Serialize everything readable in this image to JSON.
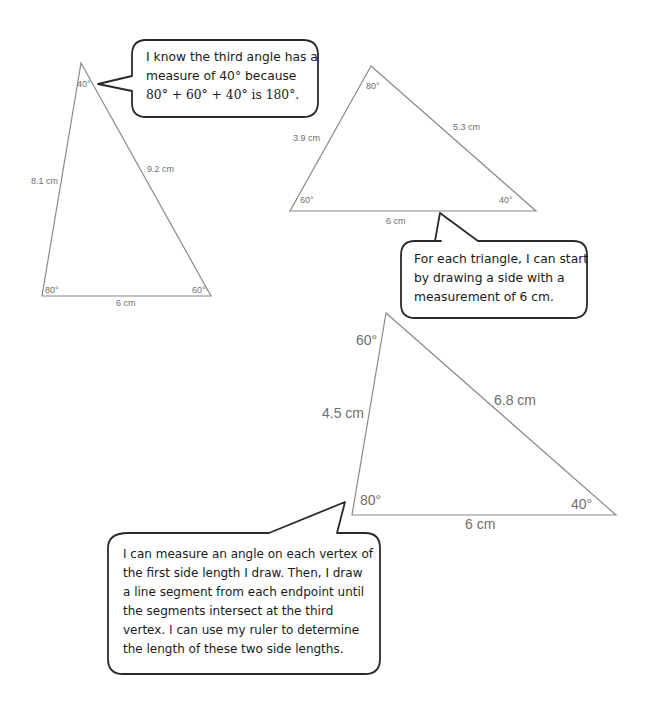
{
  "triangles": [
    {
      "id": "triangle-1",
      "angles": {
        "top": "40°",
        "bottom_left": "80°",
        "bottom_right": "60°"
      },
      "sides": {
        "left": "8.1 cm",
        "right": "9.2 cm",
        "base": "6 cm"
      }
    },
    {
      "id": "triangle-2",
      "angles": {
        "top": "80°",
        "bottom_left": "60°",
        "bottom_right": "40°"
      },
      "sides": {
        "left": "3.9 cm",
        "right": "5.3 cm",
        "base": "6 cm"
      }
    },
    {
      "id": "triangle-3",
      "angles": {
        "top": "60°",
        "bottom_left": "80°",
        "bottom_right": "40°"
      },
      "sides": {
        "left": "4.5 cm",
        "right": "6.8 cm",
        "base": "6 cm"
      }
    }
  ],
  "callouts": {
    "third_angle": {
      "lines": [
        "I know the third angle has a",
        "measure of 40° because",
        "80° + 60° + 40° is 180°."
      ]
    },
    "start_side": {
      "lines": [
        "For each triangle, I can start",
        "by drawing a side with a",
        "measurement of 6 cm."
      ]
    },
    "method": {
      "lines": [
        "I can measure an angle on each vertex of",
        "the first side length I draw.  Then, I draw",
        "a line segment from each endpoint until",
        "the segments intersect at the third",
        "vertex.  I can use my ruler to determine",
        "the length of these two side lengths."
      ]
    }
  },
  "colors": {
    "triangle_stroke": "#8a8a8a",
    "label_text": "#6e6e6e",
    "bubble_stroke": "#2a2a2a",
    "bubble_text": "#1a1a1a"
  }
}
